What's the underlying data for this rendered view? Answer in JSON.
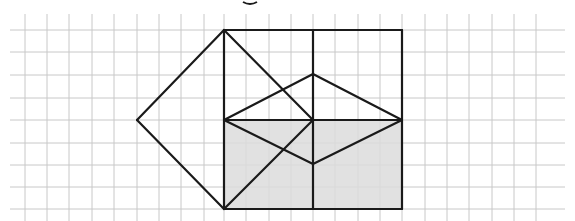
{
  "diagram": {
    "type": "geometry-on-grid",
    "canvas": {
      "width": 575,
      "height": 221
    },
    "colors": {
      "background": "#ffffff",
      "grid": "#c8c8c8",
      "stroke": "#1a1a1a",
      "shade": "#dcdcdc"
    },
    "grid": {
      "x_start": 25,
      "x_end": 555,
      "y_start": 8,
      "y_end": 221,
      "spacing": 22.35,
      "vertical_lines_x": [
        25,
        47,
        69,
        92,
        114,
        137,
        159,
        181,
        204,
        224,
        246,
        269,
        291,
        313,
        335,
        358,
        380,
        402,
        425,
        447,
        469,
        492,
        514,
        536
      ],
      "horizontal_lines_y": [
        30,
        52,
        75,
        98,
        120,
        143,
        165,
        187,
        209
      ]
    },
    "points": {
      "A": [
        224,
        30
      ],
      "B": [
        313,
        30
      ],
      "C": [
        402,
        30
      ],
      "L": [
        137,
        120
      ],
      "D": [
        224,
        120
      ],
      "O": [
        313,
        120
      ],
      "E": [
        402,
        120
      ],
      "T": [
        313,
        74
      ],
      "M": [
        313,
        164
      ],
      "F": [
        224,
        209
      ],
      "G": [
        313,
        209
      ],
      "H": [
        402,
        209
      ]
    },
    "shaded_region": {
      "label": "lower rectangle",
      "corners": [
        "D",
        "E",
        "H",
        "F"
      ]
    },
    "segments": [
      [
        "A",
        "C"
      ],
      [
        "C",
        "H"
      ],
      [
        "H",
        "F"
      ],
      [
        "F",
        "A"
      ],
      [
        "B",
        "G"
      ],
      [
        "D",
        "E"
      ],
      [
        "A",
        "L"
      ],
      [
        "L",
        "F"
      ],
      [
        "A",
        "O"
      ],
      [
        "F",
        "O"
      ],
      [
        "D",
        "T"
      ],
      [
        "T",
        "E"
      ],
      [
        "D",
        "M"
      ],
      [
        "M",
        "E"
      ]
    ],
    "top_fragment": {
      "visible": true,
      "x": 250,
      "y": 2
    }
  }
}
